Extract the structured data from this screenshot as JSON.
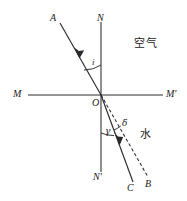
{
  "figure": {
    "kind": "physics-optics-refraction-diagram",
    "colors": {
      "line": "#2b2b2b",
      "text": "#1a1a1a",
      "background": "#ffffff"
    }
  },
  "media": {
    "upper_label": "空气",
    "lower_label": "水"
  },
  "points": {
    "A": "A",
    "B": "B",
    "C": "C",
    "M": "M",
    "M_prime": "M'",
    "N": "N",
    "N_prime": "N'",
    "O": "O"
  },
  "angles": {
    "incidence": "i",
    "refraction": "γ",
    "deviation": "δ"
  },
  "geometry": {
    "origin": {
      "x": 101,
      "y": 95
    },
    "normal": {
      "x": 101,
      "y_top": 22,
      "y_bottom": 172
    },
    "interface": {
      "y": 95,
      "x_left": 28,
      "x_right": 163
    },
    "incident_ray": {
      "x1": 60,
      "y1": 23,
      "x2": 101,
      "y2": 95
    },
    "refracted_solid_ray": {
      "x1": 101,
      "y1": 95,
      "x2": 133,
      "y2": 182
    },
    "refracted_dashed_ray": {
      "x1": 101,
      "y1": 95,
      "x2": 148,
      "y2": 177
    }
  },
  "label_positions": {
    "A": {
      "x": 50,
      "y": 13
    },
    "N": {
      "x": 97,
      "y": 13
    },
    "M": {
      "x": 13,
      "y": 90
    },
    "M_prime": {
      "x": 166,
      "y": 90
    },
    "O": {
      "x": 92,
      "y": 98
    },
    "N_prime": {
      "x": 93,
      "y": 172
    },
    "C": {
      "x": 128,
      "y": 182
    },
    "B": {
      "x": 146,
      "y": 179
    },
    "i": {
      "x": 92,
      "y": 59
    },
    "gamma": {
      "x": 106,
      "y": 128
    },
    "delta": {
      "x": 122,
      "y": 121
    },
    "air": {
      "x": 137,
      "y": 40
    },
    "water": {
      "x": 140,
      "y": 130
    }
  }
}
